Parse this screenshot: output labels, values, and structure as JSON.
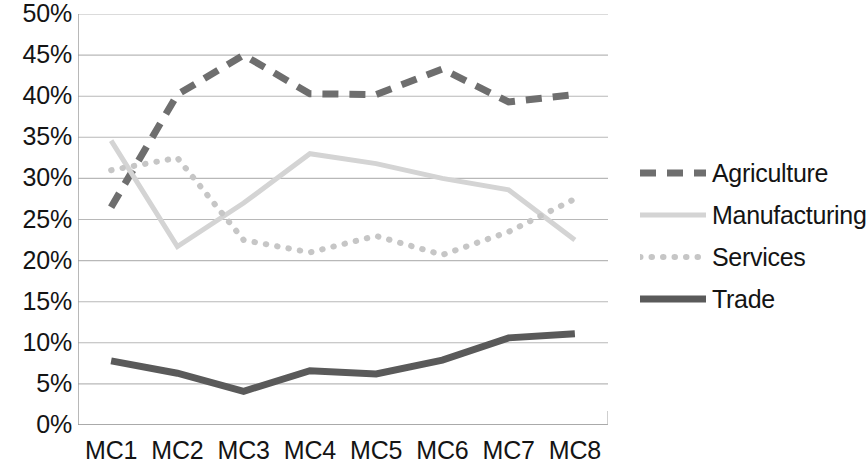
{
  "chart_data": {
    "type": "line",
    "title": "",
    "subtitle": "",
    "xlabel": "",
    "ylabel": "",
    "categories": [
      "MC1",
      "MC2",
      "MC3",
      "MC4",
      "MC5",
      "MC6",
      "MC7",
      "MC8"
    ],
    "ylim": [
      0,
      50
    ],
    "ytick_values": [
      0,
      5,
      10,
      15,
      20,
      25,
      30,
      35,
      40,
      45,
      50
    ],
    "ytick_labels": [
      "0%",
      "5%",
      "10%",
      "15%",
      "20%",
      "25%",
      "30%",
      "35%",
      "40%",
      "45%",
      "50%"
    ],
    "y_axis_format": "percent",
    "grid": {
      "horizontal": true,
      "vertical": false,
      "color": "#b8b8b8"
    },
    "legend": {
      "position": "right",
      "entries": [
        {
          "name": "Agriculture",
          "style": "dashed",
          "color": "#6e6e6e"
        },
        {
          "name": "Manufacturing",
          "style": "solid",
          "color": "#d4d4d4"
        },
        {
          "name": "Services",
          "style": "dotted",
          "color": "#c6c6c6"
        },
        {
          "name": "Trade",
          "style": "solid",
          "color": "#5a5a5a"
        }
      ]
    },
    "series": [
      {
        "name": "Agriculture",
        "style": "dashed",
        "color": "#6e6e6e",
        "width": 7,
        "dasharray": "16 11",
        "values": [
          26.5,
          40.2,
          45.0,
          40.3,
          40.2,
          43.3,
          39.3,
          40.2
        ]
      },
      {
        "name": "Manufacturing",
        "style": "solid",
        "color": "#d4d4d4",
        "width": 5,
        "dasharray": "",
        "values": [
          34.6,
          21.7,
          27.0,
          33.0,
          31.8,
          30.0,
          28.6,
          22.5
        ]
      },
      {
        "name": "Services",
        "style": "dotted",
        "color": "#c6c6c6",
        "width": 6,
        "dasharray": "0.5 11",
        "values": [
          31.0,
          32.5,
          22.5,
          21.0,
          23.0,
          20.7,
          23.5,
          27.5
        ]
      },
      {
        "name": "Trade",
        "style": "solid",
        "color": "#5a5a5a",
        "width": 7,
        "dasharray": "",
        "values": [
          7.8,
          6.3,
          4.1,
          6.6,
          6.2,
          7.9,
          10.6,
          11.1
        ]
      }
    ]
  }
}
